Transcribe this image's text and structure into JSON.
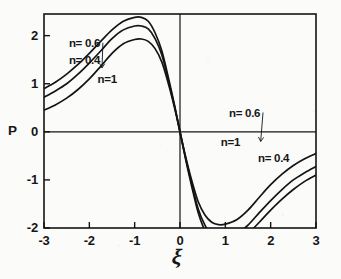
{
  "chart_data": {
    "type": "line",
    "title": "",
    "xlabel": "ξ",
    "ylabel": "P",
    "xlim": [
      -3,
      3
    ],
    "ylim": [
      -2,
      2.45
    ],
    "grid": false,
    "legend_position": "inline-annotations",
    "x_ticks": [
      "-3",
      "-2",
      "-1",
      "0",
      "1",
      "2",
      "3"
    ],
    "x_tick_values": [
      -3,
      -2,
      -1,
      0,
      1,
      2,
      3
    ],
    "y_ticks": [
      "2",
      "1",
      "0",
      "-1",
      "-2"
    ],
    "y_tick_values": [
      2,
      1,
      0,
      -1,
      -2
    ],
    "axis_note": "P axis label sits beside the 0 tick; curves are antisymmetric about the origin",
    "series": [
      {
        "name": "n = 0.4",
        "label": "n= 0.4",
        "peak": {
          "x": -0.85,
          "y": 2.38
        },
        "trough": {
          "x": 0.85,
          "y": -1.75
        },
        "x": [
          -3.0,
          -2.75,
          -2.5,
          -2.25,
          -2.0,
          -1.75,
          -1.5,
          -1.25,
          -1.0,
          -0.85,
          -0.7,
          -0.55,
          -0.4,
          -0.25,
          -0.12,
          0.0,
          0.12,
          0.25,
          0.4,
          0.55,
          0.7,
          0.85,
          1.0,
          1.25,
          1.5,
          1.75,
          2.0,
          2.25,
          2.5,
          2.75,
          3.0
        ],
        "y": [
          0.9,
          1.03,
          1.2,
          1.4,
          1.63,
          1.88,
          2.12,
          2.3,
          2.38,
          2.38,
          2.3,
          2.06,
          1.68,
          1.1,
          0.55,
          0.0,
          -0.55,
          -1.1,
          -1.68,
          -2.06,
          -2.3,
          -2.38,
          -2.38,
          -2.3,
          -2.12,
          -1.88,
          -1.63,
          -1.4,
          -1.2,
          -1.03,
          -0.9
        ]
      },
      {
        "name": "n = 0.6",
        "label": "n= 0.6",
        "peak": {
          "x": -0.85,
          "y": 2.2
        },
        "trough": {
          "x": 0.85,
          "y": -1.6
        },
        "x": [
          -3.0,
          -2.75,
          -2.5,
          -2.25,
          -2.0,
          -1.75,
          -1.5,
          -1.25,
          -1.0,
          -0.85,
          -0.7,
          -0.55,
          -0.4,
          -0.25,
          -0.12,
          0.0,
          0.12,
          0.25,
          0.4,
          0.55,
          0.7,
          0.85,
          1.0,
          1.25,
          1.5,
          1.75,
          2.0,
          2.25,
          2.5,
          2.75,
          3.0
        ],
        "y": [
          0.72,
          0.85,
          1.0,
          1.2,
          1.43,
          1.68,
          1.94,
          2.12,
          2.2,
          2.2,
          2.14,
          1.94,
          1.6,
          1.05,
          0.53,
          0.0,
          -0.53,
          -1.05,
          -1.6,
          -1.94,
          -2.14,
          -2.2,
          -2.2,
          -2.12,
          -1.94,
          -1.68,
          -1.43,
          -1.2,
          -1.0,
          -0.85,
          -0.72
        ]
      },
      {
        "name": "n = 1",
        "label": "n=1",
        "peak": {
          "x": -0.85,
          "y": 1.93
        },
        "trough": {
          "x": 0.85,
          "y": -1.35
        },
        "x": [
          -3.0,
          -2.75,
          -2.5,
          -2.25,
          -2.0,
          -1.75,
          -1.5,
          -1.25,
          -1.0,
          -0.85,
          -0.7,
          -0.55,
          -0.4,
          -0.25,
          -0.12,
          0.0,
          0.12,
          0.25,
          0.4,
          0.55,
          0.7,
          0.85,
          1.0,
          1.25,
          1.5,
          1.75,
          2.0,
          2.25,
          2.5,
          2.75,
          3.0
        ],
        "y": [
          0.45,
          0.56,
          0.7,
          0.88,
          1.1,
          1.36,
          1.63,
          1.83,
          1.92,
          1.93,
          1.88,
          1.73,
          1.45,
          0.98,
          0.5,
          0.0,
          -0.5,
          -0.98,
          -1.45,
          -1.73,
          -1.88,
          -1.93,
          -1.92,
          -1.83,
          -1.63,
          -1.36,
          -1.1,
          -0.88,
          -0.7,
          -0.56,
          -0.45
        ]
      }
    ],
    "annotations": [
      {
        "id": "left-n06",
        "text": "n= 0.6",
        "x": -2.45,
        "y": 1.83,
        "leader_to": {
          "x": -1.72,
          "y": 1.33
        }
      },
      {
        "id": "left-n04",
        "text": "n= 0.4",
        "x": -2.45,
        "y": 1.47,
        "leader_to": null
      },
      {
        "id": "left-n1",
        "text": "n=1",
        "x": -1.82,
        "y": 1.07,
        "leader_to": null
      },
      {
        "id": "right-n06",
        "text": "n= 0.6",
        "x": 1.08,
        "y": 0.38,
        "leader_to": {
          "x": 1.78,
          "y": -0.2
        }
      },
      {
        "id": "right-n1",
        "text": "n=1",
        "x": 0.9,
        "y": -0.24,
        "leader_to": null
      },
      {
        "id": "right-n04",
        "text": "n= 0.4",
        "x": 1.72,
        "y": -0.56,
        "leader_to": null
      }
    ]
  },
  "axis": {
    "y_label": "P",
    "x_label": "ξ"
  },
  "colors": {
    "curve": "#141414",
    "axis": "#141414",
    "frame": "#141414",
    "background": "#fbfbfa",
    "text": "#161616"
  }
}
